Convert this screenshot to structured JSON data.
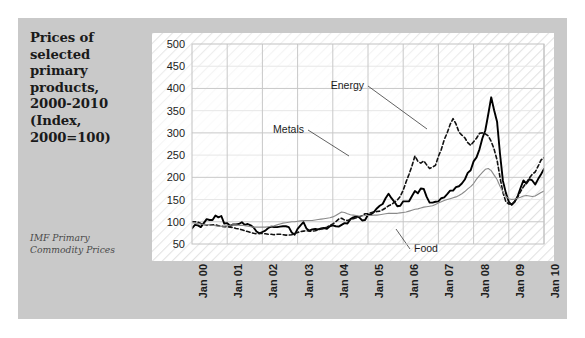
{
  "figure": {
    "background_color": "#ffffff",
    "panel_color": "#c9c9c9",
    "plot_color": "#ffffff"
  },
  "caption": {
    "title": "Prices of\nselected\nprimary\nproducts,\n2000-2010\n(Index,\n2000=100)",
    "source": "IMF Primary\nCommodity Prices"
  },
  "chart_data": {
    "type": "line",
    "title": "Prices of selected primary products, 2000-2010 (Index, 2000=100)",
    "subtitle": "",
    "source": "IMF Primary Commodity Prices",
    "xlabel": "",
    "ylabel": "",
    "ylim": [
      50,
      500
    ],
    "yticks": [
      50,
      100,
      150,
      200,
      250,
      300,
      350,
      400,
      450,
      500
    ],
    "xticks": [
      "Jan 00",
      "Jan 01",
      "Jan 02",
      "Jan 03",
      "Jan 04",
      "Jan 05",
      "Jan 06",
      "Jan 07",
      "Jan 08",
      "Jan 09",
      "Jan 10"
    ],
    "grid": true,
    "legend_position": "inline-annotations",
    "x_start": "Jan 00",
    "x_end": "Jul 10",
    "x_frequency": "monthly",
    "annotations": [
      {
        "text": "Energy",
        "series": "Energy",
        "x_label": "Jan 07",
        "y_value": 400
      },
      {
        "text": "Metals",
        "series": "Metals",
        "x_label": "Jul 05",
        "y_value": 323
      },
      {
        "text": "Food",
        "series": "Food",
        "x_label": "Jan 09",
        "y_value": 78
      }
    ],
    "series": [
      {
        "name": "Energy",
        "style": "solid",
        "color": "#000000",
        "width": 1.9,
        "values": [
          85,
          93,
          92,
          88,
          97,
          106,
          104,
          104,
          114,
          110,
          113,
          96,
          97,
          91,
          94,
          94,
          95,
          99,
          93,
          95,
          92,
          87,
          78,
          74,
          77,
          80,
          86,
          89,
          88,
          88,
          89,
          90,
          90,
          88,
          76,
          71,
          84,
          92,
          99,
          85,
          80,
          83,
          84,
          83,
          85,
          86,
          84,
          90,
          92,
          90,
          89,
          93,
          97,
          96,
          106,
          110,
          112,
          110,
          103,
          104,
          116,
          116,
          122,
          130,
          136,
          140,
          153,
          163,
          153,
          145,
          135,
          136,
          146,
          146,
          146,
          158,
          169,
          164,
          175,
          174,
          156,
          143,
          143,
          145,
          146,
          153,
          155,
          162,
          170,
          170,
          178,
          180,
          186,
          195,
          210,
          216,
          236,
          245,
          263,
          288,
          306,
          342,
          380,
          351,
          325,
          253,
          192,
          165,
          145,
          138,
          145,
          157,
          176,
          193,
          186,
          196,
          193,
          184,
          196,
          207,
          219,
          208,
          224,
          233,
          216,
          229,
          239
        ]
      },
      {
        "name": "Metals",
        "style": "dashed",
        "color": "#111111",
        "width": 1.6,
        "values": [
          100,
          100,
          99,
          96,
          94,
          93,
          93,
          93,
          93,
          91,
          90,
          89,
          89,
          88,
          87,
          85,
          84,
          82,
          80,
          78,
          76,
          74,
          73,
          74,
          74,
          73,
          72,
          72,
          71,
          72,
          72,
          71,
          70,
          70,
          71,
          74,
          76,
          78,
          79,
          80,
          79,
          79,
          80,
          82,
          84,
          85,
          88,
          92,
          95,
          100,
          106,
          108,
          104,
          103,
          105,
          107,
          109,
          111,
          114,
          118,
          118,
          120,
          122,
          123,
          124,
          127,
          131,
          136,
          139,
          144,
          149,
          157,
          171,
          190,
          207,
          226,
          248,
          236,
          232,
          237,
          228,
          220,
          223,
          227,
          247,
          263,
          285,
          300,
          319,
          332,
          320,
          302,
          295,
          289,
          278,
          272,
          280,
          288,
          299,
          300,
          298,
          293,
          281,
          263,
          239,
          200,
          166,
          145,
          140,
          139,
          146,
          155,
          168,
          179,
          188,
          198,
          207,
          212,
          225,
          239,
          244,
          237,
          246,
          247,
          235,
          241,
          249
        ]
      },
      {
        "name": "Food",
        "style": "solid",
        "color": "#8a8a8a",
        "width": 1.1,
        "values": [
          98,
          97,
          96,
          95,
          94,
          94,
          93,
          92,
          91,
          90,
          90,
          90,
          91,
          92,
          93,
          93,
          92,
          92,
          91,
          90,
          89,
          88,
          88,
          88,
          88,
          88,
          89,
          90,
          91,
          93,
          95,
          97,
          98,
          99,
          100,
          100,
          101,
          102,
          103,
          103,
          103,
          103,
          104,
          105,
          106,
          107,
          108,
          109,
          111,
          114,
          118,
          122,
          121,
          118,
          116,
          115,
          114,
          113,
          113,
          114,
          114,
          114,
          115,
          115,
          116,
          117,
          118,
          119,
          119,
          119,
          119,
          120,
          121,
          122,
          124,
          126,
          128,
          129,
          131,
          133,
          134,
          135,
          136,
          139,
          142,
          145,
          148,
          150,
          152,
          154,
          156,
          159,
          163,
          168,
          174,
          179,
          186,
          196,
          204,
          211,
          218,
          220,
          215,
          205,
          195,
          180,
          167,
          157,
          152,
          150,
          151,
          153,
          155,
          158,
          159,
          158,
          157,
          158,
          162,
          166,
          169,
          168,
          170,
          172,
          170,
          172,
          174
        ]
      }
    ]
  }
}
